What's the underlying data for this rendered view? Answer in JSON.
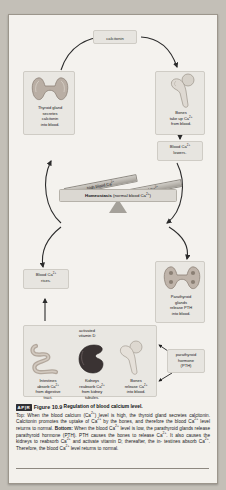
{
  "figure": {
    "badge": "AP|R",
    "number": "Figure 10.9",
    "title": "Regulation of blood calcium level.",
    "caption_top_lead": "Top:",
    "caption_body": "When the blood calcium (Ca2+) level is high, the thyroid gland secretes calcitonin. Calcitonin promotes the uptake of Ca2+ by the bones, and therefore the blood Ca2+ level returns to normal. Bottom: When the blood Ca2+ level is low, the parathyroid glands release parathyroid hormone (PTH). PTH causes the bones to release Ca2+. It also causes the kidneys to reabsorb Ca2+ and activate vitamin D; thereafter, the intestines absorb Ca2+. Therefore, the blood Ca2+ level returns to normal."
  },
  "diagram": {
    "hormone_top": "calcitonin",
    "thyroid": {
      "label": "Thyroid gland\nsecretes\ncalcitonin\ninto blood.",
      "icon": "thyroid-gland-illustration"
    },
    "bones_uptake": {
      "label": "Bones\ntake up Ca2+\nfrom blood.",
      "icon": "femur-bone-illustration"
    },
    "blood_lowers": "Blood Ca2+\nlowers.",
    "blood_rises": "Blood Ca2+\nrises.",
    "parathyroid": {
      "label": "Parathyroid\nglands\nrelease PTH\ninto blood.",
      "icon": "parathyroid-glands-illustration"
    },
    "pth_callout": "parathyroid\nhormone\n(PTH)",
    "balance": {
      "high": "high blood Ca2+",
      "low": "low blood Ca2+",
      "center_bold": "Homeostasis",
      "center_rest": "(normal blood Ca2+)"
    },
    "effectors": {
      "vitamin_d": "activated\nvitamin D",
      "items": [
        {
          "name": "intestines",
          "icon": "intestines-illustration",
          "label": "Intestines\nabsorb Ca2+\nfrom digestive\ntract."
        },
        {
          "name": "kidneys",
          "icon": "kidney-illustration",
          "label": "Kidneys\nreabsorb Ca2+\nfrom kidney\ntubules."
        },
        {
          "name": "bones",
          "icon": "femur-bone-illustration",
          "label": "Bones\nrelease Ca2+\ninto blood."
        }
      ]
    }
  }
}
